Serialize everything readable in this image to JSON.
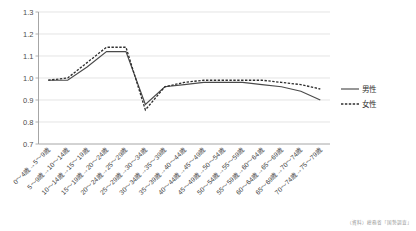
{
  "chart_data": {
    "type": "line",
    "title": "",
    "xlabel": "",
    "ylabel": "",
    "ylim": [
      0.7,
      1.3
    ],
    "yticks": [
      0.7,
      0.8,
      0.9,
      1.0,
      1.1,
      1.2,
      1.3
    ],
    "ytick_labels": [
      "0.7",
      "0.8",
      "0.9",
      "1.0",
      "1.1",
      "1.2",
      "1.3"
    ],
    "grid": true,
    "legend_position": "right",
    "categories": [
      "0～4歳→5～9歳",
      "5～9歳→10～14歳",
      "10～14歳→15～19歳",
      "15～19歳→20～24歳",
      "20～24歳→25～29歳",
      "25～29歳→30～34歳",
      "30～34歳→35～39歳",
      "35～39歳→40～44歳",
      "40～44歳→45～49歳",
      "45～49歳→50～54歳",
      "50～54歳→55～59歳",
      "55～59歳→60～64歳",
      "60～64歳→65～69歳",
      "65～69歳→70～74歳",
      "70～74歳→75～79歳"
    ],
    "series": [
      {
        "name": "男性",
        "style": "solid",
        "color": "#4a4a4a",
        "values": [
          0.99,
          0.99,
          1.05,
          1.12,
          1.12,
          0.88,
          0.96,
          0.97,
          0.98,
          0.98,
          0.98,
          0.97,
          0.96,
          0.94,
          0.9
        ]
      },
      {
        "name": "女性",
        "style": "dashed",
        "color": "#2f2f2f",
        "values": [
          0.99,
          1.0,
          1.07,
          1.14,
          1.14,
          0.855,
          0.96,
          0.98,
          0.99,
          0.99,
          0.99,
          0.99,
          0.98,
          0.97,
          0.95
        ]
      }
    ]
  },
  "legend": {
    "items": [
      {
        "label": "男性",
        "style": "solid"
      },
      {
        "label": "女性",
        "style": "dashed"
      }
    ]
  },
  "source": {
    "text": "（資料）総務省「国勢調査」"
  }
}
